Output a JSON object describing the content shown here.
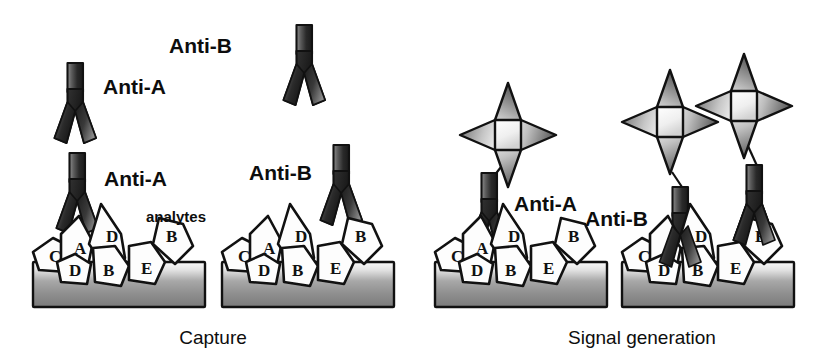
{
  "figure": {
    "title": "",
    "background_color": "#ffffff",
    "panels": [
      {
        "id": "capture",
        "label": "Capture"
      },
      {
        "id": "signal",
        "label": "Signal generation"
      }
    ]
  },
  "labels": {
    "anti_a": "Anti-A",
    "anti_b": "Anti-B",
    "analytes": "analytes",
    "capture": "Capture",
    "signal_generation": "Signal generation"
  },
  "colors": {
    "background": "#ffffff",
    "outline": "#111111",
    "antibody_dark": "#2b2b2b",
    "antibody_mid": "#6b6b6b",
    "antibody_light": "#a9a9a9",
    "substrate_top": "#f2f2f2",
    "substrate_mid": "#9a9a9a",
    "substrate_bottom": "#777777",
    "analyte_fill": "#fdfdfd",
    "star_light": "#f5f5f5",
    "star_mid": "#8e8e8e",
    "star_dark": "#5a5a5a",
    "text": "#0d0d0d"
  },
  "free_antibodies": [
    {
      "name": "free-antibody-anti-a",
      "label": "Anti-A",
      "label_side": "right"
    },
    {
      "name": "free-antibody-anti-b",
      "label": "Anti-B",
      "label_side": "left"
    }
  ],
  "analyte_clusters": [
    {
      "name": "analyte-cluster-capture-a",
      "letters": [
        "C",
        "A",
        "D",
        "D",
        "B",
        "E",
        "B"
      ]
    },
    {
      "name": "analyte-cluster-capture-b",
      "letters": [
        "C",
        "A",
        "D",
        "D",
        "B",
        "E",
        "B"
      ]
    },
    {
      "name": "analyte-cluster-signal-a",
      "letters": [
        "C",
        "A",
        "D",
        "D",
        "B",
        "E",
        "B"
      ]
    },
    {
      "name": "analyte-cluster-signal-b",
      "letters": [
        "C",
        "A",
        "D",
        "D",
        "B",
        "E",
        "B"
      ]
    }
  ],
  "analyte_letters": {
    "c": "C",
    "a": "A",
    "d1": "D",
    "d2": "D",
    "b1": "B",
    "e": "E",
    "b2": "B"
  },
  "signal_markers": {
    "shape": "four-point-star",
    "count_group_a": 1,
    "count_group_b": 2
  },
  "bound_antibodies": {
    "capture_group_a": "Anti-A",
    "capture_group_b": "Anti-B",
    "signal_group_a": "Anti-A",
    "signal_group_b": "Anti-B"
  }
}
